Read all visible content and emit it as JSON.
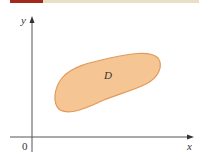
{
  "diagram": {
    "title": "",
    "axes": {
      "x_label": "x",
      "y_label": "y",
      "origin_label": "0"
    },
    "region": {
      "label": "D",
      "fill_color": "#f6c594",
      "stroke_color": "#e29a5a"
    },
    "colors": {
      "accent_red": "#a3281d",
      "accent_tan": "#e9dfc3",
      "axis": "#555555"
    }
  }
}
